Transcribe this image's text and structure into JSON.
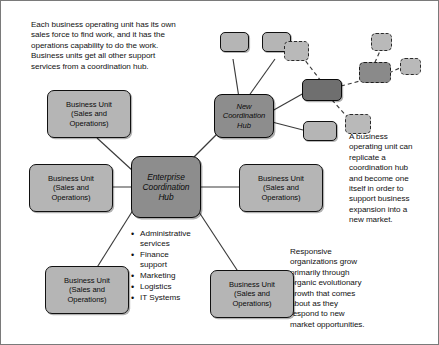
{
  "diagram": {
    "background_color": "#ffffff",
    "border_color": "#7a7a7a",
    "colors": {
      "unit_fill": "#b5b5b5",
      "hub_fill": "#8d8d8d",
      "dark_node_fill": "#6f6f6f",
      "ghost_fill": "#b9b9b9",
      "outline": "#111111",
      "edge": "#3a3a3a"
    }
  },
  "notes": {
    "top_left": "Each business operating unit has its own\nsales force to find work, and it has the\noperations capability to do the work.\nBusiness units get all other support\nservices from a coordination hub.",
    "right_middle": "A business\noperating unit can\nreplicate a\ncoordination hub\nand become one\nitself in order to\nsupport business\nexpansion into a\nnew market.",
    "bottom_right": "Responsive\norganizations grow\nprimarily through\norganic evolutionary\ngrowth that comes\nabout as they\nrespond to new\nmarket opportunities."
  },
  "hubs": {
    "enterprise": "Enterprise\nCoordination\nHub",
    "new": "New\nCoordination\nHub"
  },
  "business_units": [
    {
      "id": "bu-top-left",
      "label": "Business Unit\n(Sales and\nOperations)"
    },
    {
      "id": "bu-mid-left",
      "label": "Business Unit\n(Sales and\nOperations)"
    },
    {
      "id": "bu-bottom-left",
      "label": "Business Unit\n(Sales and\nOperations)"
    },
    {
      "id": "bu-right",
      "label": "Business Unit\n(Sales and\nOperations)"
    },
    {
      "id": "bu-bottom-right",
      "label": "Business Unit\n(Sales and\nOperations)"
    }
  ],
  "services": [
    "Administrative\nservices",
    "Finance\nsupport",
    "Marketing",
    "Logistics",
    "IT Systems"
  ],
  "satellites": {
    "top_small_left": "",
    "top_small_right": "",
    "below_right": "",
    "replicated_hub": "",
    "ghost_upper": "",
    "ghost_top_far": "",
    "ghost_right": "",
    "ghost_lower": ""
  }
}
